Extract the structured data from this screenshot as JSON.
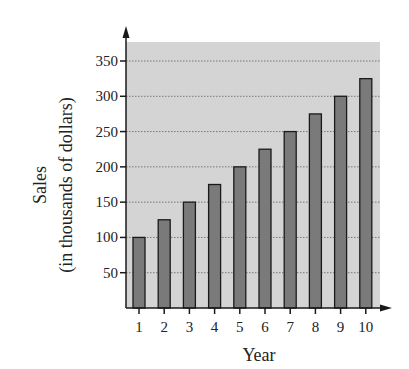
{
  "chart_data": {
    "type": "bar",
    "title": "",
    "xlabel": "Year",
    "ylabel": "Sales",
    "ylabel_sub": "(in thousands of dollars)",
    "categories": [
      "1",
      "2",
      "3",
      "4",
      "5",
      "6",
      "7",
      "8",
      "9",
      "10"
    ],
    "values": [
      100,
      125,
      150,
      175,
      200,
      225,
      250,
      275,
      300,
      325
    ],
    "yticks": [
      50,
      100,
      150,
      200,
      250,
      300,
      350
    ],
    "ylim": [
      0,
      375
    ],
    "grid": true,
    "grid_style": "dotted horizontal",
    "legend": null
  },
  "colors": {
    "plot_background": "#d4d4d4",
    "bar_fill": "#7a7a7a",
    "bar_stroke": "#1a1a1a",
    "axis": "#1a1a1a",
    "grid": "#777777"
  }
}
